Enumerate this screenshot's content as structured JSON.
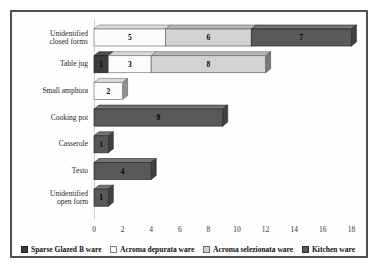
{
  "chart": {
    "background_color": "#ffffff",
    "frame_border_color": "#4f4f4f",
    "wall_line_color": "#cccccc",
    "tick_label_color": "#333333",
    "bar_value_label_color": "#000000"
  },
  "chart_data": {
    "type": "bar",
    "subtype": "horizontal-stacked-3d",
    "title": "",
    "xlabel": "",
    "ylabel": "",
    "categories": [
      "Unidentified\nclosed forms",
      "Table jug",
      "Small amphora",
      "Cooking pot",
      "Casserole",
      "Testo",
      "Unidentified\nopen form"
    ],
    "series": [
      {
        "name": "Sparse Glazed B ware",
        "color": "#3d3d3d",
        "values": [
          0,
          1,
          0,
          0,
          0,
          0,
          0
        ]
      },
      {
        "name": "Acroma depurata ware",
        "color": "#fcfcfc",
        "values": [
          5,
          3,
          2,
          0,
          0,
          0,
          0
        ]
      },
      {
        "name": "Acroma selezionata ware",
        "color": "#d3d3d3",
        "values": [
          6,
          8,
          0,
          0,
          0,
          0,
          0
        ]
      },
      {
        "name": "Kitchen ware",
        "color": "#595959",
        "values": [
          7,
          0,
          0,
          9,
          1,
          4,
          1
        ]
      }
    ],
    "x_ticks": [
      0,
      2,
      4,
      6,
      8,
      10,
      12,
      14,
      16,
      18
    ],
    "xlim": [
      0,
      18
    ],
    "grid": false,
    "bar_value_labels_shown": true,
    "legend_position": "bottom"
  }
}
